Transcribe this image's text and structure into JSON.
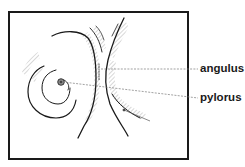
{
  "diagram": {
    "type": "anatomical-sketch",
    "labels": [
      {
        "id": "angulus",
        "text": "angulus"
      },
      {
        "id": "pylorus",
        "text": "pylorus"
      }
    ],
    "colors": {
      "line": "#1a1a1a",
      "hatch": "#9a9a9a",
      "leader": "#7a7a7a",
      "background": "#ffffff"
    }
  }
}
